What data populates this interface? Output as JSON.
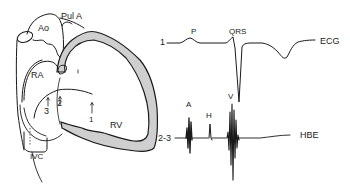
{
  "figure": {
    "type": "anatomical-diagram-with-tracings",
    "heart": {
      "labels": {
        "aorta": "Ao",
        "pulmonary_artery": "Pul A",
        "right_atrium": "RA",
        "right_ventricle": "RV",
        "inferior_vena_cava": "IVC"
      },
      "catheter_positions": [
        "1",
        "2",
        "3"
      ]
    },
    "ecg": {
      "lead_marker": "1",
      "label": "ECG",
      "waves": {
        "p": "P",
        "qrs": "QRS"
      }
    },
    "hbe": {
      "lead_marker": "2-3",
      "label": "HBE",
      "deflections": {
        "atrial": "A",
        "his": "H",
        "ventricular": "V"
      }
    },
    "colors": {
      "ink": "#1a1a1a",
      "myocardium_fill": "#cfcfcf",
      "background": "#ffffff"
    }
  }
}
